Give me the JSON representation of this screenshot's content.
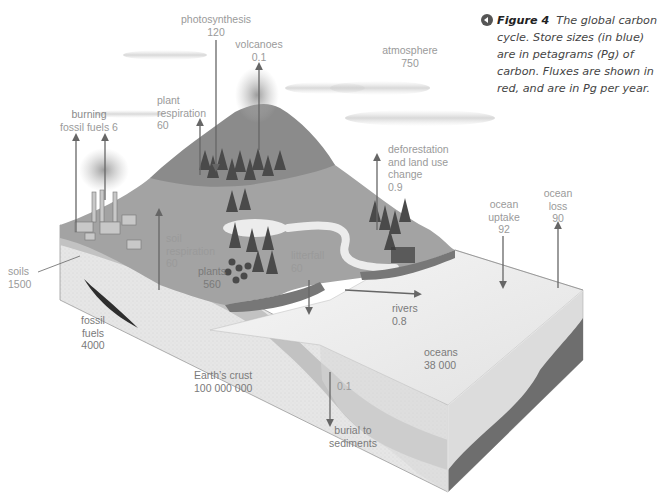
{
  "caption": {
    "figure_label": "Figure 4",
    "text": "The global carbon cycle. Store sizes (in blue) are in petagrams (Pg) of carbon. Fluxes are shown in red, and are in Pg per year.",
    "icon": "back-arrow-circle-icon"
  },
  "stores": {
    "atmosphere": {
      "label": "atmosphere",
      "value": "750"
    },
    "soils": {
      "label": "soils",
      "value": "1500"
    },
    "plants": {
      "label": "plants",
      "value": "560"
    },
    "fossil_fuels": {
      "label_1": "fossil",
      "label_2": "fuels",
      "value": "4000"
    },
    "earths_crust": {
      "label": "Earth’s crust",
      "value": "100 000 000"
    },
    "oceans": {
      "label": "oceans",
      "value": "38 000"
    }
  },
  "fluxes": {
    "photosynthesis": {
      "label": "photosynthesis",
      "value": "120",
      "direction": "down"
    },
    "volcanoes": {
      "label": "volcanoes",
      "value": "0.1",
      "direction": "up"
    },
    "burning_fossil_fuels": {
      "label_1": "burning",
      "label_2": "fossil fuels 6",
      "value": "6",
      "direction": "up"
    },
    "plant_respiration": {
      "label_1": "plant",
      "label_2": "respiration",
      "value": "60",
      "direction": "up"
    },
    "soil_respiration": {
      "label_1": "soil",
      "label_2": "respiration",
      "value": "60",
      "direction": "up"
    },
    "litterfall": {
      "label": "litterfall",
      "value": "60",
      "direction": "down"
    },
    "deforestation": {
      "label_1": "deforestation",
      "label_2": "and land use",
      "label_3": "change",
      "value": "0.9",
      "direction": "up"
    },
    "rivers": {
      "label": "rivers",
      "value": "0.8",
      "direction": "right"
    },
    "ocean_uptake": {
      "label_1": "ocean",
      "label_2": "uptake",
      "value": "92",
      "direction": "down"
    },
    "ocean_loss": {
      "label_1": "ocean",
      "label_2": "loss",
      "value": "90",
      "direction": "up"
    },
    "burial": {
      "value": "0.1",
      "label_1": "burial to",
      "label_2": "sediments",
      "direction": "down"
    }
  },
  "colors": {
    "label_text": "#9a9a9a",
    "arrow": "#6a6a6a",
    "crust": "#e4e4e4",
    "soil_band": "#bdbdbd",
    "land": "#9e9e9e",
    "mountain": "#8a8a8a",
    "ocean_top": "#eeeeee",
    "ocean_floor": "#6e6e6e"
  }
}
